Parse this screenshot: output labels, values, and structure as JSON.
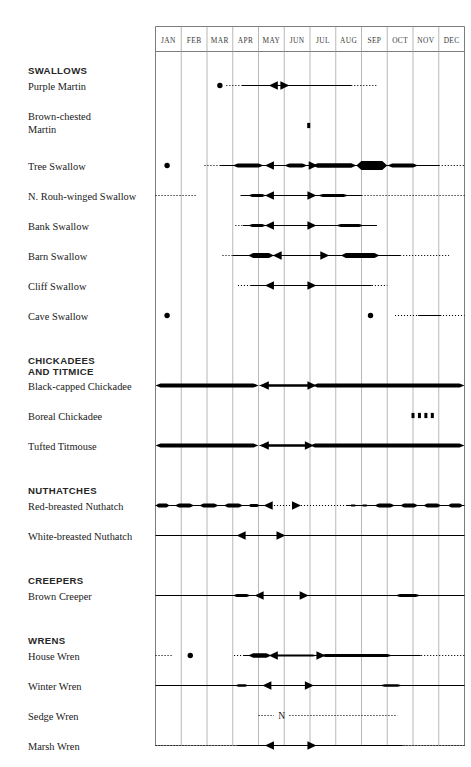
{
  "chart_data": {
    "type": "table",
    "xlabel": "",
    "ylabel": "",
    "grid": true,
    "legend": "none",
    "categories": [
      "JAN",
      "FEB",
      "MAR",
      "APR",
      "MAY",
      "JUN",
      "JUL",
      "AUG",
      "SEP",
      "OCT",
      "NOV",
      "DEC"
    ],
    "xlim": [
      0,
      12
    ],
    "axis_note": "x axis = months of the year, 12 equal columns",
    "groups": [
      {
        "name": "SWALLOWS",
        "species": [
          {
            "name": "Purple Martin",
            "dots": [
              2.5
            ],
            "squares": [],
            "dotted": [
              [
                2.75,
                3.35
              ],
              [
                7.6,
                8.6
              ]
            ],
            "solid": [
              [
                3.35,
                7.6
              ]
            ],
            "thick": [],
            "arrows": [
              {
                "x": 4.75,
                "dir": "left"
              },
              {
                "x": 4.85,
                "dir": "right"
              }
            ]
          },
          {
            "name": "Brown-chested Martin",
            "dots": [],
            "squares": [
              5.95
            ],
            "dotted": [],
            "solid": [],
            "thick": [],
            "arrows": []
          },
          {
            "name": "Tree Swallow",
            "dots": [
              0.45
            ],
            "squares": [],
            "dotted": [
              [
                1.9,
                2.5
              ],
              [
                11.0,
                12.0
              ]
            ],
            "solid": [
              [
                2.5,
                11.0
              ]
            ],
            "thick": [
              {
                "from": 3.0,
                "to": 4.2,
                "w": 4.0
              },
              {
                "from": 5.0,
                "to": 5.9,
                "w": 4.0
              },
              {
                "from": 6.1,
                "to": 7.8,
                "w": 4.6
              },
              {
                "from": 7.8,
                "to": 9.0,
                "w": 9.0
              },
              {
                "from": 9.0,
                "to": 10.2,
                "w": 4.0
              }
            ],
            "arrows": [
              {
                "x": 4.6,
                "dir": "left"
              },
              {
                "x": 5.95,
                "dir": "right"
              }
            ]
          },
          {
            "name": "N. Rouh-winged Swallow",
            "dots": [],
            "squares": [],
            "dotted": [
              [
                -0.05,
                1.6
              ],
              [
                8.0,
                12.0
              ]
            ],
            "solid": [
              [
                3.3,
                8.0
              ]
            ],
            "thick": [
              {
                "from": 3.6,
                "to": 4.3,
                "w": 3.2
              },
              {
                "from": 6.3,
                "to": 7.5,
                "w": 3.2
              }
            ],
            "arrows": [
              {
                "x": 4.6,
                "dir": "left"
              },
              {
                "x": 5.9,
                "dir": "right"
              }
            ]
          },
          {
            "name": "Bank Swallow",
            "dots": [],
            "squares": [],
            "dotted": [
              [
                3.1,
                3.4
              ]
            ],
            "solid": [
              [
                3.4,
                8.6
              ]
            ],
            "thick": [
              {
                "from": 3.6,
                "to": 4.3,
                "w": 3.0
              },
              {
                "from": 7.0,
                "to": 8.1,
                "w": 3.0
              }
            ],
            "arrows": [
              {
                "x": 4.6,
                "dir": "left"
              },
              {
                "x": 5.9,
                "dir": "right"
              }
            ]
          },
          {
            "name": "Barn Swallow",
            "dots": [],
            "squares": [],
            "dotted": [
              [
                2.6,
                3.0
              ],
              [
                9.5,
                11.4
              ]
            ],
            "solid": [
              [
                3.0,
                9.5
              ]
            ],
            "thick": [
              {
                "from": 3.6,
                "to": 4.6,
                "w": 5.2
              },
              {
                "from": 7.2,
                "to": 8.7,
                "w": 5.2
              }
            ],
            "arrows": [
              {
                "x": 4.9,
                "dir": "left"
              },
              {
                "x": 6.4,
                "dir": "right"
              }
            ]
          },
          {
            "name": "Cliff Swallow",
            "dots": [],
            "squares": [],
            "dotted": [
              [
                3.2,
                3.7
              ],
              [
                8.4,
                9.0
              ]
            ],
            "solid": [
              [
                3.7,
                8.4
              ]
            ],
            "thick": [],
            "arrows": [
              {
                "x": 4.6,
                "dir": "left"
              },
              {
                "x": 5.9,
                "dir": "right"
              }
            ]
          },
          {
            "name": "Cave Swallow",
            "dots": [
              0.45,
              8.35
            ],
            "squares": [],
            "dotted": [
              [
                9.3,
                12.0
              ]
            ],
            "solid": [
              [
                10.2,
                11.1
              ]
            ],
            "thick": [],
            "arrows": []
          }
        ]
      },
      {
        "name": "CHICKADEES AND TITMICE",
        "species": [
          {
            "name": "Black-capped Chickadee",
            "dots": [],
            "squares": [],
            "dotted": [],
            "solid": [],
            "thick": [
              {
                "from": 0.0,
                "to": 4.0,
                "w": 4.2
              },
              {
                "from": 4.0,
                "to": 6.1,
                "w": 2.6
              },
              {
                "from": 6.1,
                "to": 12.0,
                "w": 4.2
              }
            ],
            "arrows": [
              {
                "x": 4.4,
                "dir": "left"
              },
              {
                "x": 5.9,
                "dir": "right"
              }
            ]
          },
          {
            "name": "Boreal Chickadee",
            "dots": [],
            "squares": [
              10.0,
              10.25,
              10.5,
              10.75
            ],
            "dotted": [],
            "solid": [],
            "thick": [],
            "arrows": []
          },
          {
            "name": "Tufted Titmouse",
            "dots": [],
            "squares": [],
            "dotted": [],
            "solid": [],
            "thick": [
              {
                "from": 0.0,
                "to": 4.0,
                "w": 4.0
              },
              {
                "from": 4.0,
                "to": 6.0,
                "w": 2.4
              },
              {
                "from": 6.0,
                "to": 12.0,
                "w": 4.0
              }
            ],
            "arrows": [
              {
                "x": 4.4,
                "dir": "left"
              },
              {
                "x": 5.8,
                "dir": "right"
              }
            ]
          }
        ]
      },
      {
        "name": "NUTHATCHES",
        "species": [
          {
            "name": "Red-breasted Nuthatch",
            "dots": [],
            "squares": [],
            "dotted": [
              [
                4.6,
                7.4
              ]
            ],
            "solid": [
              [
                0.0,
                4.3
              ],
              [
                7.4,
                12.0
              ]
            ],
            "thick": [
              {
                "from": 0.0,
                "to": 0.55,
                "w": 4.0
              },
              {
                "from": 0.75,
                "to": 1.5,
                "w": 4.0
              },
              {
                "from": 1.7,
                "to": 2.45,
                "w": 4.0
              },
              {
                "from": 2.65,
                "to": 3.4,
                "w": 4.0
              },
              {
                "from": 3.6,
                "to": 4.05,
                "w": 3.2
              },
              {
                "from": 7.55,
                "to": 7.8,
                "w": 2.2
              },
              {
                "from": 8.0,
                "to": 8.25,
                "w": 2.2
              },
              {
                "from": 8.5,
                "to": 9.3,
                "w": 4.0
              },
              {
                "from": 9.5,
                "to": 10.2,
                "w": 4.0
              },
              {
                "from": 10.4,
                "to": 11.1,
                "w": 4.0
              },
              {
                "from": 11.35,
                "to": 11.95,
                "w": 4.0
              }
            ],
            "arrows": [
              {
                "x": 4.55,
                "dir": "left"
              },
              {
                "x": 5.3,
                "dir": "right"
              }
            ]
          },
          {
            "name": "White-breasted Nuthatch",
            "dots": [],
            "squares": [],
            "dotted": [],
            "solid": [
              [
                0.0,
                12.0
              ]
            ],
            "thick": [],
            "arrows": [
              {
                "x": 3.5,
                "dir": "left"
              },
              {
                "x": 4.7,
                "dir": "right"
              }
            ]
          }
        ]
      },
      {
        "name": "CREEPERS",
        "species": [
          {
            "name": "Brown Creeper",
            "dots": [],
            "squares": [],
            "dotted": [],
            "solid": [
              [
                0.0,
                12.0
              ]
            ],
            "thick": [
              {
                "from": 3.0,
                "to": 3.7,
                "w": 2.8
              },
              {
                "from": 9.3,
                "to": 10.3,
                "w": 2.8
              }
            ],
            "arrows": [
              {
                "x": 4.2,
                "dir": "left"
              },
              {
                "x": 5.6,
                "dir": "right"
              }
            ]
          }
        ]
      },
      {
        "name": "WRENS",
        "species": [
          {
            "name": "House Wren",
            "dots": [
              1.35
            ],
            "squares": [],
            "dotted": [
              [
                -0.05,
                0.7
              ],
              [
                3.05,
                3.4
              ],
              [
                10.2,
                12.0
              ]
            ],
            "solid": [
              [
                3.4,
                10.3
              ]
            ],
            "thick": [
              {
                "from": 3.6,
                "to": 4.5,
                "w": 4.6
              },
              {
                "from": 4.5,
                "to": 6.3,
                "w": 2.0
              },
              {
                "from": 6.4,
                "to": 9.2,
                "w": 3.0
              }
            ],
            "arrows": [
              {
                "x": 4.75,
                "dir": "left"
              },
              {
                "x": 6.25,
                "dir": "right"
              }
            ]
          },
          {
            "name": "Winter Wren",
            "dots": [],
            "squares": [],
            "dotted": [],
            "solid": [
              [
                0.0,
                12.0
              ]
            ],
            "thick": [
              {
                "from": 3.1,
                "to": 3.6,
                "w": 2.6
              },
              {
                "from": 8.7,
                "to": 9.6,
                "w": 2.6
              }
            ],
            "arrows": [
              {
                "x": 4.5,
                "dir": "left"
              },
              {
                "x": 5.8,
                "dir": "right"
              }
            ]
          },
          {
            "name": "Sedge Wren",
            "dots": [],
            "squares": [],
            "dotted": [
              [
                4.0,
                4.6
              ],
              [
                5.2,
                9.4
              ]
            ],
            "solid": [],
            "thick": [],
            "arrows": [],
            "note": "N",
            "note_x": 4.9
          },
          {
            "name": "Marsh Wren",
            "dots": [],
            "squares": [],
            "dotted": [
              [
                -0.05,
                3.2
              ],
              [
                9.4,
                12.0
              ]
            ],
            "solid": [
              [
                3.2,
                9.6
              ]
            ],
            "thick": [],
            "arrows": [
              {
                "x": 4.6,
                "dir": "left"
              },
              {
                "x": 5.9,
                "dir": "right"
              }
            ]
          },
          {
            "name": "Carolina Wren",
            "dots": [],
            "squares": [],
            "dotted": [],
            "solid": [],
            "thick": [
              {
                "from": 0.0,
                "to": 3.1,
                "w": 2.6
              },
              {
                "from": 3.1,
                "to": 6.0,
                "w": 3.4
              },
              {
                "from": 6.0,
                "to": 12.0,
                "w": 2.6
              }
            ],
            "arrows": [
              {
                "x": 3.6,
                "dir": "left"
              },
              {
                "x": 5.85,
                "dir": "right"
              }
            ]
          }
        ]
      }
    ]
  }
}
